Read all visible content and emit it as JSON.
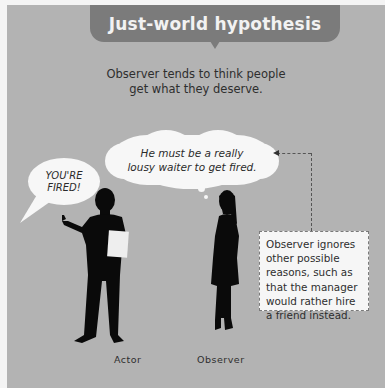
{
  "title": "Just-world hypothesis",
  "subtitle": {
    "line1": "Observer tends to think people",
    "line2": "get what they deserve."
  },
  "actor_speech": {
    "line1": "YOU'RE",
    "line2": "FIRED!"
  },
  "observer_thought": {
    "line1": "He must be a really",
    "line2": "lousy waiter to get fired."
  },
  "note": {
    "lines": [
      "Observer ignores",
      "other possible",
      "reasons, such as",
      "that the manager",
      "would rather hire",
      "a friend instead."
    ]
  },
  "labels": {
    "actor": "Actor",
    "observer": "Observer"
  },
  "colors": {
    "background": "#b3b3b3",
    "title_tab": "#7b7b7b",
    "bubble": "#f7f7f7",
    "silhouette": "#0a0a0a",
    "border": "#f4f4f4"
  }
}
